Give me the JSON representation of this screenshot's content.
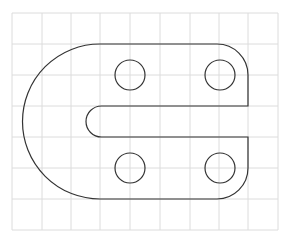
{
  "diagram": {
    "type": "mechanical-part-drawing",
    "colors": {
      "background": "#ffffff",
      "grid": "#dcdcdc",
      "outline": "#333333"
    },
    "grid": {
      "x_lines": [
        12,
        42,
        71,
        100,
        130,
        160,
        190,
        219,
        248,
        278
      ],
      "y_lines": [
        13,
        44,
        75,
        106,
        137,
        168,
        199,
        230
      ],
      "x_min": 12,
      "x_max": 278,
      "y_min": 13,
      "y_max": 230
    },
    "outline_path": "M100,44 L217,44 A31,31 0 0 1 248,75 L248,106 L101.5,106 A15.5,15.5 0 0 0 101.5,137 L248,137 L248,168 A31,31 0 0 1 217,199 L100,199 A77.5,77.5 0 0 1 100,44 Z",
    "holes": [
      {
        "name": "hole-top-left",
        "cx": 130,
        "cy": 75,
        "r": 15
      },
      {
        "name": "hole-top-right",
        "cx": 220,
        "cy": 75,
        "r": 15
      },
      {
        "name": "hole-bottom-left",
        "cx": 130,
        "cy": 168,
        "r": 15
      },
      {
        "name": "hole-bottom-right",
        "cx": 220,
        "cy": 168,
        "r": 15
      }
    ]
  }
}
